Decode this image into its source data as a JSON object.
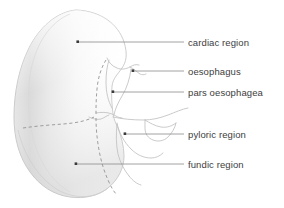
{
  "figure": {
    "view": "lateral schematic"
  },
  "colors": {
    "outline": "#b9b9b9",
    "inner_outline": "#c2c2c2",
    "dashed_border": "#8d8d8d",
    "leader_line": "#8a8a8a",
    "leader_dot": "#3a3a3a",
    "text": "#3d3d3d",
    "fill_light": "#fdfdfd",
    "fill_shade": "#d8d8d8",
    "background": "#ffffff"
  },
  "labels": [
    {
      "id": "cardiac-region",
      "text": "cardiac region",
      "x": 188,
      "y": 37,
      "dot": {
        "x": 78,
        "y": 42
      },
      "line_end": {
        "x": 184,
        "y": 42
      }
    },
    {
      "id": "oesophagus",
      "text": "oesophagus",
      "x": 188,
      "y": 66,
      "dot": {
        "x": 133,
        "y": 71
      },
      "line_end": {
        "x": 184,
        "y": 71
      }
    },
    {
      "id": "pars-oesophagea",
      "text": "pars oesophagea",
      "x": 188,
      "y": 87,
      "dot": {
        "x": 113,
        "y": 92
      },
      "line_end": {
        "x": 184,
        "y": 92
      }
    },
    {
      "id": "pyloric-region",
      "text": "pyloric region",
      "x": 188,
      "y": 129,
      "dot": {
        "x": 125,
        "y": 134
      },
      "line_end": {
        "x": 184,
        "y": 134
      }
    },
    {
      "id": "fundic-region",
      "text": "fundic region",
      "x": 188,
      "y": 159,
      "dot": {
        "x": 76,
        "y": 164
      },
      "line_end": {
        "x": 184,
        "y": 164
      }
    }
  ],
  "icons": {
    "leader_dot": "bullet-dot",
    "leader_line": "horizontal-rule"
  }
}
